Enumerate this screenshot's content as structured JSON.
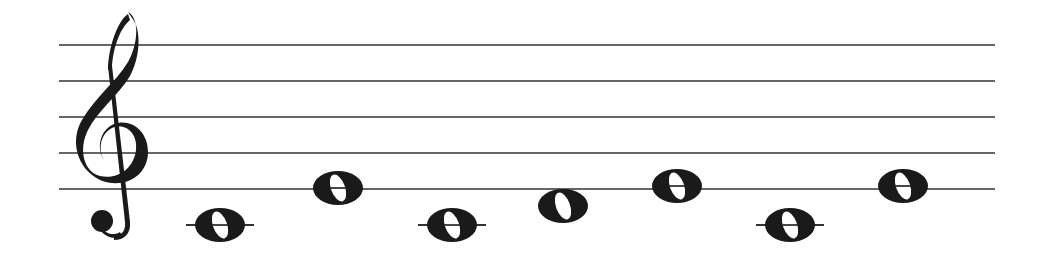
{
  "staff": {
    "clef": "treble",
    "x_start": 59,
    "x_end": 995,
    "line_y": [
      45,
      81,
      117,
      153,
      189
    ],
    "line_color": "#333333"
  },
  "notes": [
    {
      "pitch": "C4",
      "duration": "whole",
      "x": 220,
      "y": 225,
      "ledger": true
    },
    {
      "pitch": "E4",
      "duration": "whole",
      "x": 338,
      "y": 188,
      "ledger": false
    },
    {
      "pitch": "C4",
      "duration": "whole",
      "x": 452,
      "y": 225,
      "ledger": true
    },
    {
      "pitch": "D4",
      "duration": "whole",
      "x": 563,
      "y": 206,
      "ledger": false
    },
    {
      "pitch": "E4",
      "duration": "whole",
      "x": 677,
      "y": 186,
      "ledger": false
    },
    {
      "pitch": "C4",
      "duration": "whole",
      "x": 790,
      "y": 225,
      "ledger": true
    },
    {
      "pitch": "E4",
      "duration": "whole",
      "x": 903,
      "y": 186,
      "ledger": false
    }
  ],
  "ink_color": "#1a1a1a"
}
